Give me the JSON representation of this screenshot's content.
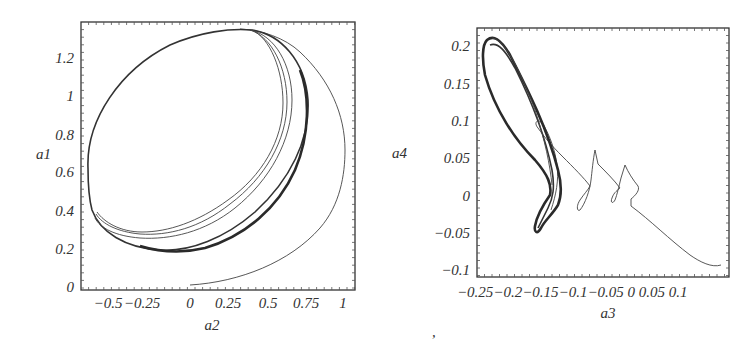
{
  "chart_data": [
    {
      "type": "line",
      "subtype": "phase-portrait",
      "title": "",
      "xlabel": "a2",
      "ylabel": "a1",
      "xlim": [
        -0.71,
        1.08
      ],
      "ylim": [
        -0.02,
        1.38
      ],
      "xticks": [
        "-0.5",
        "-0.25",
        "0",
        "0.25",
        "0.5",
        "0.75",
        "1"
      ],
      "yticks": [
        "0",
        "0.2",
        "0.4",
        "0.6",
        "0.8",
        "1",
        "1.2"
      ],
      "grid": false,
      "legend": null,
      "description": "Trajectory spirals from (0, 0.01) outward along a large arc (max a2≈1.02 at a1≈0.8) onto a limit cycle: tilted ellipse spanning a2 from about -0.68 to 0.8 and a1 from about 0.2 to 1.35.",
      "series": [
        {
          "name": "transient",
          "points": [
            [
              0.0,
              0.01
            ],
            [
              0.3,
              0.05
            ],
            [
              0.6,
              0.2
            ],
            [
              0.85,
              0.45
            ],
            [
              1.0,
              0.75
            ],
            [
              1.02,
              0.9
            ],
            [
              0.95,
              1.1
            ],
            [
              0.75,
              1.28
            ],
            [
              0.45,
              1.35
            ]
          ]
        },
        {
          "name": "limit-cycle",
          "points": [
            [
              -0.68,
              0.65
            ],
            [
              -0.6,
              0.95
            ],
            [
              -0.35,
              1.2
            ],
            [
              0.0,
              1.33
            ],
            [
              0.3,
              1.35
            ],
            [
              0.6,
              1.25
            ],
            [
              0.78,
              1.0
            ],
            [
              0.78,
              0.8
            ],
            [
              0.6,
              0.55
            ],
            [
              0.3,
              0.32
            ],
            [
              0.0,
              0.22
            ],
            [
              -0.2,
              0.2
            ],
            [
              -0.45,
              0.28
            ],
            [
              -0.65,
              0.45
            ],
            [
              -0.68,
              0.65
            ]
          ]
        }
      ]
    },
    {
      "type": "line",
      "subtype": "phase-portrait",
      "title": "",
      "xlabel": "a3",
      "ylabel": "a4",
      "xlim": [
        -0.265,
        0.105
      ],
      "ylim": [
        -0.11,
        0.225
      ],
      "xticks": [
        "-0.25",
        "-0.2",
        "-0.15",
        "-0.1",
        "-0.05",
        "0",
        "0.05",
        "0.1"
      ],
      "yticks": [
        "-0.1",
        "-0.05",
        "0",
        "0.05",
        "0.1",
        "0.15",
        "0.2"
      ],
      "grid": false,
      "legend": null,
      "description": "Trajectory starts near (0.09, -0.1), moves up-left in a zigzag with small loops near a3=-0.04, -0.08, -0.12, then settles into a thick attractor loop between a3≈-0.25..-0.13 and a4≈-0.045..0.215.",
      "series": [
        {
          "name": "transient",
          "points": [
            [
              0.09,
              -0.098
            ],
            [
              0.06,
              -0.085
            ],
            [
              0.0,
              -0.05
            ],
            [
              -0.055,
              -0.015
            ],
            [
              -0.055,
              0.0
            ],
            [
              -0.045,
              0.005
            ],
            [
              -0.075,
              0.045
            ],
            [
              -0.08,
              0.0
            ],
            [
              -0.078,
              -0.01
            ],
            [
              -0.072,
              0.01
            ],
            [
              -0.095,
              0.035
            ],
            [
              -0.105,
              0.08
            ],
            [
              -0.11,
              0.02
            ],
            [
              -0.12,
              -0.02
            ],
            [
              -0.115,
              0.01
            ],
            [
              -0.13,
              0.05
            ],
            [
              -0.16,
              0.1
            ],
            [
              -0.17,
              0.14
            ],
            [
              -0.16,
              0.12
            ],
            [
              -0.145,
              0.06
            ],
            [
              -0.14,
              0.02
            ],
            [
              -0.15,
              -0.02
            ]
          ]
        },
        {
          "name": "attractor",
          "points": [
            [
              -0.255,
              0.21
            ],
            [
              -0.25,
              0.215
            ],
            [
              -0.24,
              0.21
            ],
            [
              -0.2,
              0.15
            ],
            [
              -0.16,
              0.08
            ],
            [
              -0.135,
              0.02
            ],
            [
              -0.15,
              -0.01
            ],
            [
              -0.165,
              -0.04
            ],
            [
              -0.175,
              -0.045
            ],
            [
              -0.17,
              -0.02
            ],
            [
              -0.16,
              0.01
            ],
            [
              -0.165,
              0.05
            ],
            [
              -0.2,
              0.1
            ],
            [
              -0.24,
              0.16
            ],
            [
              -0.255,
              0.2
            ],
            [
              -0.255,
              0.21
            ]
          ]
        }
      ]
    }
  ],
  "left_plot": {
    "xlabel": "a2",
    "ylabel": "a1",
    "xticks": [
      {
        "label": "−0.5",
        "x": 108
      },
      {
        "label": "−0.25",
        "x": 142
      },
      {
        "label": "0",
        "x": 190
      },
      {
        "label": "0.25",
        "x": 228
      },
      {
        "label": "0.5",
        "x": 268
      },
      {
        "label": "0.75",
        "x": 306
      },
      {
        "label": "1",
        "x": 343
      }
    ],
    "yticks": [
      {
        "label": "0",
        "y": 287
      },
      {
        "label": "0.2",
        "y": 249
      },
      {
        "label": "0.4",
        "y": 211
      },
      {
        "label": "0.6",
        "y": 172
      },
      {
        "label": "0.8",
        "y": 135
      },
      {
        "label": "1",
        "y": 96
      },
      {
        "label": "1.2",
        "y": 58
      }
    ]
  },
  "right_plot": {
    "xlabel": "a3",
    "ylabel": "a4",
    "xtick_text": "−0.25−0.2−0.15−0.1−0.05 0  0.05 0.1",
    "yticks": [
      {
        "label": "0.2",
        "y": 46
      },
      {
        "label": "0.15",
        "y": 84
      },
      {
        "label": "0.1",
        "y": 121
      },
      {
        "label": "0.05",
        "y": 158
      },
      {
        "label": "0",
        "y": 196
      },
      {
        "label": "−0.05",
        "y": 233
      },
      {
        "label": "−0.1",
        "y": 270
      }
    ]
  },
  "footer_mark": ","
}
